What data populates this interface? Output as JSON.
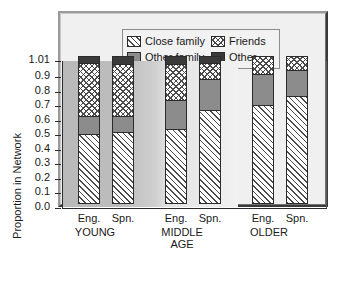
{
  "legend": {
    "items": [
      {
        "label": "Close family",
        "pattern": "pat-close",
        "icon": "diagonal-hatch-swatch"
      },
      {
        "label": "Friends",
        "pattern": "pat-friends",
        "icon": "cross-hatch-swatch"
      },
      {
        "label": "Other family",
        "pattern": "pat-otherfam",
        "icon": "gray-fill-swatch"
      },
      {
        "label": "Other",
        "pattern": "pat-other",
        "icon": "dark-fill-swatch"
      }
    ]
  },
  "axis": {
    "y_title": "Proportion in Network",
    "y_ticks": [
      "1.01",
      "0.9",
      "0.8",
      "0.7",
      "0.6",
      "0.5",
      "0.4",
      "0.3",
      "0.2",
      "0.1",
      "0.0"
    ],
    "group_labels": [
      "YOUNG",
      "MIDDLE\nAGE",
      "OLDER"
    ],
    "group_label_lines": [
      [
        "YOUNG"
      ],
      [
        "MIDDLE",
        "AGE"
      ],
      [
        "OLDER"
      ]
    ],
    "bar_labels": [
      "Eng.",
      "Spn.",
      "Eng.",
      "Spn.",
      "Eng.",
      "Spn."
    ]
  },
  "chart_data": {
    "type": "bar",
    "subtype": "stacked",
    "title": "",
    "xlabel": "",
    "ylabel": "Proportion in Network",
    "ylim": [
      0.0,
      1.01
    ],
    "ytick_values": [
      1.01,
      0.9,
      0.8,
      0.7,
      0.6,
      0.5,
      0.4,
      0.3,
      0.2,
      0.1,
      0.0
    ],
    "grid": false,
    "legend_position": "top-left-inside",
    "categories": [
      "Eng.",
      "Spn.",
      "Eng.",
      "Spn.",
      "Eng.",
      "Spn."
    ],
    "groups": [
      "YOUNG",
      "MIDDLE AGE",
      "OLDER"
    ],
    "series": [
      {
        "name": "Close family",
        "values": [
          0.48,
          0.49,
          0.51,
          0.64,
          0.68,
          0.74
        ]
      },
      {
        "name": "Other family",
        "values": [
          0.12,
          0.11,
          0.2,
          0.22,
          0.21,
          0.18
        ]
      },
      {
        "name": "Friends",
        "values": [
          0.37,
          0.36,
          0.25,
          0.11,
          0.12,
          0.09
        ]
      },
      {
        "name": "Other",
        "values": [
          0.04,
          0.05,
          0.05,
          0.04,
          0.0,
          0.0
        ]
      }
    ],
    "cumulative_tops": {
      "Close family": [
        0.48,
        0.49,
        0.51,
        0.64,
        0.68,
        0.74
      ],
      "Other family": [
        0.6,
        0.6,
        0.71,
        0.86,
        0.89,
        0.92
      ],
      "Friends": [
        0.97,
        0.96,
        0.96,
        0.97,
        1.01,
        1.01
      ],
      "Other": [
        1.01,
        1.01,
        1.01,
        1.01,
        1.01,
        1.01
      ]
    },
    "bars": [
      {
        "group": "YOUNG",
        "label": "Eng.",
        "close_family": 0.48,
        "other_family": 0.12,
        "friends": 0.37,
        "other": 0.04
      },
      {
        "group": "YOUNG",
        "label": "Spn.",
        "close_family": 0.49,
        "other_family": 0.11,
        "friends": 0.36,
        "other": 0.05
      },
      {
        "group": "MIDDLE AGE",
        "label": "Eng.",
        "close_family": 0.51,
        "other_family": 0.2,
        "friends": 0.25,
        "other": 0.05
      },
      {
        "group": "MIDDLE AGE",
        "label": "Spn.",
        "close_family": 0.64,
        "other_family": 0.22,
        "friends": 0.11,
        "other": 0.04
      },
      {
        "group": "OLDER",
        "label": "Eng.",
        "close_family": 0.68,
        "other_family": 0.21,
        "friends": 0.12,
        "other": 0.0
      },
      {
        "group": "OLDER",
        "label": "Spn.",
        "close_family": 0.74,
        "other_family": 0.18,
        "friends": 0.09,
        "other": 0.0
      }
    ]
  }
}
